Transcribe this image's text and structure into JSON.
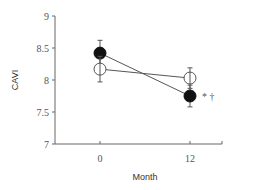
{
  "chart_data": {
    "type": "line",
    "title": "",
    "xlabel": "Month",
    "ylabel": "CAVI",
    "x": [
      0,
      12
    ],
    "x_tick_labels": [
      "0",
      "12"
    ],
    "y_tick_labels": [
      "7",
      "7.5",
      "8",
      "8.5",
      "9"
    ],
    "ylim": [
      7,
      9
    ],
    "grid": false,
    "legend": null,
    "series": [
      {
        "name": "filled",
        "marker": "filled-circle",
        "values": [
          8.42,
          7.75
        ],
        "error": [
          0.2,
          0.17
        ]
      },
      {
        "name": "open",
        "marker": "open-circle",
        "values": [
          8.17,
          8.03
        ],
        "error": [
          0.2,
          0.16
        ]
      }
    ],
    "annotations": [
      {
        "x": 12,
        "series": "filled",
        "text": "*†"
      }
    ]
  },
  "labels": {
    "xlabel": "Month",
    "ylabel": "CAVI",
    "annotation": "* †"
  }
}
